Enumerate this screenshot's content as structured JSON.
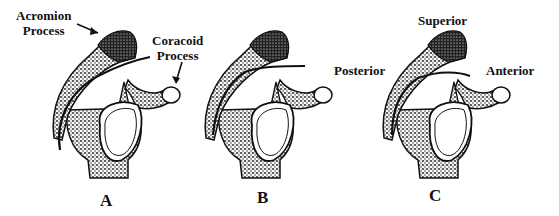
{
  "figure": {
    "panels": [
      {
        "id": "A",
        "letter": "A",
        "annotations": [
          {
            "text_line1": "Acromion",
            "text_line2": "Process"
          },
          {
            "text_line1": "Coracoid",
            "text_line2": "Process"
          }
        ]
      },
      {
        "id": "B",
        "letter": "B"
      },
      {
        "id": "C",
        "letter": "C",
        "orientation_labels": {
          "superior": "Superior",
          "posterior": "Posterior",
          "anterior": "Anterior"
        }
      }
    ],
    "colors": {
      "ink": "#111111",
      "stipple": "#1a1a1a",
      "background": "#ffffff"
    }
  }
}
